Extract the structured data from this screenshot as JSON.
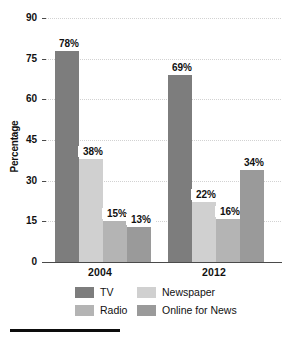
{
  "chart_data": {
    "type": "bar",
    "title": "",
    "xlabel": "",
    "ylabel": "Percentage",
    "categories": [
      "2004",
      "2012"
    ],
    "series": [
      {
        "name": "TV",
        "color": "#7d7d7d",
        "values": [
          78,
          69
        ],
        "labels": [
          "78%",
          "69%"
        ]
      },
      {
        "name": "Newspaper",
        "color": "#d0d0d0",
        "values": [
          38,
          22
        ],
        "labels": [
          "38%",
          "22%"
        ]
      },
      {
        "name": "Radio",
        "color": "#b4b4b4",
        "values": [
          15,
          16
        ],
        "labels": [
          "15%",
          "16%"
        ]
      },
      {
        "name": "Online for News",
        "color": "#9a9a9a",
        "values": [
          13,
          34
        ],
        "labels": [
          "13%",
          "34%"
        ]
      }
    ],
    "ylim": [
      0,
      90
    ],
    "yticks": [
      0,
      15,
      30,
      45,
      60,
      75,
      90
    ],
    "ytick_labels": [
      "0",
      "15",
      "30",
      "45",
      "60",
      "75",
      "90"
    ],
    "grid": true,
    "legend_position": "bottom"
  },
  "axis": {
    "y_title": "Percentage",
    "ticks": [
      "90",
      "75",
      "60",
      "45",
      "30",
      "15",
      "0"
    ]
  },
  "categories": {
    "first": "2004",
    "second": "2012"
  },
  "legend": {
    "tv": "TV",
    "newspaper": "Newspaper",
    "radio": "Radio",
    "online": "Online for News"
  },
  "values": {
    "y2004": {
      "tv": "78%",
      "newspaper": "38%",
      "radio": "15%",
      "online": "13%"
    },
    "y2012": {
      "tv": "69%",
      "newspaper": "22%",
      "radio": "16%",
      "online": "34%"
    }
  },
  "colors": {
    "tv": "#7d7d7d",
    "newspaper": "#d0d0d0",
    "radio": "#b4b4b4",
    "online": "#9a9a9a",
    "axis": "#4a4a4a",
    "grid": "#d2d2d2",
    "text": "#111111"
  }
}
